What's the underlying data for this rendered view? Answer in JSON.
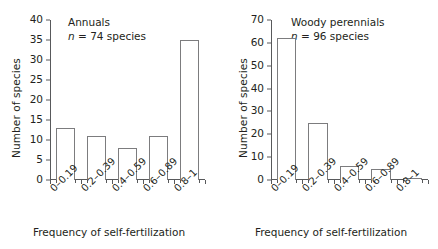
{
  "figure": {
    "background": "#ffffff",
    "bar_fill": "#ffffff",
    "bar_stroke": "#7c7c7e",
    "axis_color": "#58595b",
    "text_color": "#231f20"
  },
  "panels": [
    {
      "key": "annuals",
      "title": "Annuals",
      "n_prefix": "n",
      "n_text": " = 74 species",
      "ylabel": "Number of species",
      "xlabel": "Frequency of self-fertilization",
      "yticks": [
        "0",
        "5",
        "10",
        "15",
        "20",
        "25",
        "30",
        "35",
        "40"
      ],
      "categories": [
        "0–0.19",
        "0.2–0.39",
        "0.4–0.59",
        "0.6–0.89",
        "0.8–1"
      ],
      "values": [
        13,
        11,
        8,
        11,
        35
      ]
    },
    {
      "key": "woody-perennials",
      "title": "Woody perennials",
      "n_prefix": "n",
      "n_text": " = 96 species",
      "ylabel": "Number of species",
      "xlabel": "Frequency of self-fertilization",
      "yticks": [
        "0",
        "10",
        "20",
        "30",
        "40",
        "50",
        "60",
        "70"
      ],
      "categories": [
        "0–0.19",
        "0.2–0.39",
        "0.4–0.59",
        "0.6–0.89",
        "0.8–1"
      ],
      "values": [
        62,
        25,
        6,
        5,
        1
      ]
    }
  ],
  "chart_data": [
    {
      "type": "bar",
      "title": "Annuals",
      "annotation": "n = 74 species",
      "categories": [
        "0–0.19",
        "0.2–0.39",
        "0.4–0.59",
        "0.6–0.89",
        "0.8–1"
      ],
      "values": [
        13,
        11,
        8,
        11,
        35
      ],
      "xlabel": "Frequency of self-fertilization",
      "ylabel": "Number of species",
      "ylim": [
        0,
        40
      ],
      "ytick_step": 5,
      "grid": false,
      "legend": "none"
    },
    {
      "type": "bar",
      "title": "Woody perennials",
      "annotation": "n = 96 species",
      "categories": [
        "0–0.19",
        "0.2–0.39",
        "0.4–0.59",
        "0.6–0.89",
        "0.8–1"
      ],
      "values": [
        62,
        25,
        6,
        5,
        1
      ],
      "xlabel": "Frequency of self-fertilization",
      "ylabel": "Number of species",
      "ylim": [
        0,
        70
      ],
      "ytick_step": 10,
      "grid": false,
      "legend": "none"
    }
  ]
}
